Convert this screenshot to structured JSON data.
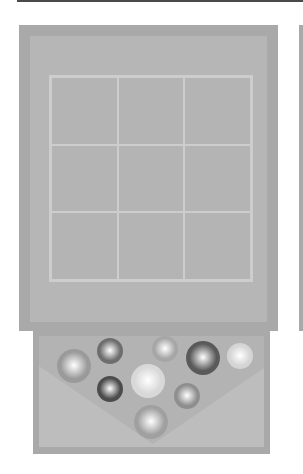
{
  "game": {
    "name": "3x3 marble puzzle board",
    "board": {
      "rows": 3,
      "cols": 3,
      "cells": [
        "",
        "",
        "",
        "",
        "",
        "",
        "",
        "",
        ""
      ]
    },
    "tray": {
      "balls": [
        {
          "id": 1,
          "cx": 74,
          "cy": 366,
          "r": 17,
          "shade": "#9a9a9a"
        },
        {
          "id": 2,
          "cx": 110,
          "cy": 351,
          "r": 13,
          "shade": "#6e6e6e"
        },
        {
          "id": 3,
          "cx": 165,
          "cy": 349,
          "r": 13,
          "shade": "#a6a6a6"
        },
        {
          "id": 4,
          "cx": 203,
          "cy": 358,
          "r": 17,
          "shade": "#5a5a5a"
        },
        {
          "id": 5,
          "cx": 240,
          "cy": 356,
          "r": 13,
          "shade": "#d4d4d4"
        },
        {
          "id": 6,
          "cx": 110,
          "cy": 389,
          "r": 13,
          "shade": "#4c4c4c"
        },
        {
          "id": 7,
          "cx": 148,
          "cy": 381,
          "r": 17,
          "shade": "#d8d8d8"
        },
        {
          "id": 8,
          "cx": 187,
          "cy": 396,
          "r": 13,
          "shade": "#8e8e8e"
        },
        {
          "id": 9,
          "cx": 151,
          "cy": 422,
          "r": 17,
          "shade": "#a0a0a0"
        }
      ]
    }
  },
  "colors": {
    "frame": "#a9a9a9",
    "board": "#b6b6b6",
    "grid_line": "#cdcdcd",
    "top_bar": "#4a4a4a"
  }
}
